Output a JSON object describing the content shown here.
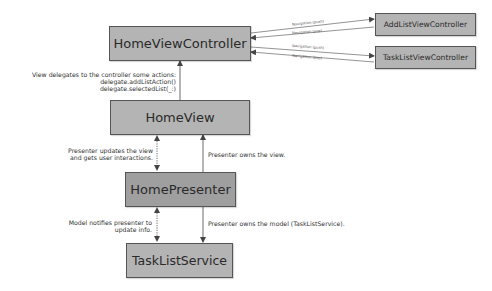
{
  "diagram": {
    "nodes": {
      "home_view_controller": "HomeViewController",
      "add_list_view_controller": "AddListViewController",
      "task_list_view_controller": "TaskListViewController",
      "home_view": "HomeView",
      "home_presenter": "HomePresenter",
      "task_list_service": "TaskListService"
    },
    "navigation_labels": {
      "push_1": "Navigation (push)",
      "pop_1": "Navigation (pop)",
      "push_2": "Navigation (push)",
      "pop_2": "Navigation (pop)"
    },
    "annotations": {
      "view_delegates_line1": "View delegates to the controller some actions:",
      "view_delegates_line2": "delegate.addListAction()",
      "view_delegates_line3": "delegate.selectedList(_:)",
      "presenter_updates_line1": "Presenter updates the view",
      "presenter_updates_line2": "and gets user interactions.",
      "presenter_owns_view": "Presenter owns the view.",
      "model_notifies_line1": "Model notifies presenter  to",
      "model_notifies_line2": "update info.",
      "presenter_owns_model": "Presenter owns the model (TaskListService)."
    },
    "colors": {
      "box_fill": "#b4b4b4",
      "presenter_fill": "#9f9f9f",
      "border": "#555555",
      "arrow": "#444444"
    }
  }
}
